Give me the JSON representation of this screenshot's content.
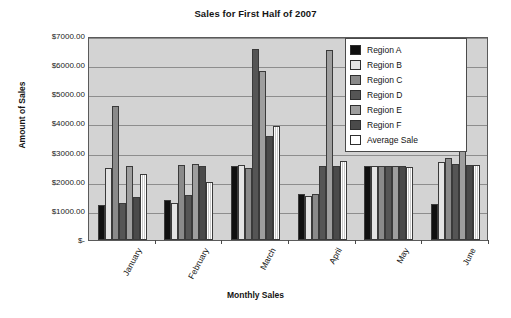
{
  "chart_data": {
    "type": "bar",
    "title": "Sales for First Half of 2007",
    "xlabel": "Monthly Sales",
    "ylabel": "Amount of Sales",
    "categories": [
      "January",
      "February",
      "March",
      "April",
      "May",
      "June"
    ],
    "ylim": [
      0,
      7000
    ],
    "grid": true,
    "legend_position": "top-right",
    "y_ticks": [
      {
        "value": 7000,
        "label": "$7000.00"
      },
      {
        "value": 6000,
        "label": "$6000.00"
      },
      {
        "value": 5000,
        "label": "$5000.00"
      },
      {
        "value": 4000,
        "label": "$4000.00"
      },
      {
        "value": 3000,
        "label": "$3000.00"
      },
      {
        "value": 2000,
        "label": "$2000.00"
      },
      {
        "value": 1000,
        "label": "$1000.00"
      },
      {
        "value": 0,
        "label": "$-"
      }
    ],
    "series": [
      {
        "name": "Region A",
        "color": "#101010",
        "values": [
          1200,
          1360,
          2550,
          1570,
          2550,
          1240
        ]
      },
      {
        "name": "Region B",
        "color": "#e3e3e3",
        "values": [
          2480,
          1260,
          2570,
          1500,
          2540,
          2660
        ]
      },
      {
        "name": "Region C",
        "color": "#8a8a8a",
        "values": [
          4590,
          2560,
          2480,
          1570,
          2550,
          2830
        ]
      },
      {
        "name": "Region D",
        "color": "#555555",
        "values": [
          1270,
          1550,
          6570,
          2530,
          2550,
          2620
        ]
      },
      {
        "name": "Region E",
        "color": "#9e9e9e",
        "values": [
          2550,
          2600,
          5790,
          6530,
          2550,
          3540
        ]
      },
      {
        "name": "Region F",
        "color": "#4a4a4a",
        "values": [
          1460,
          2550,
          3570,
          2540,
          2540,
          2560
        ]
      },
      {
        "name": "Average Sale",
        "color": "#ffffff",
        "values": [
          2270,
          1980,
          3920,
          2710,
          2520,
          2560
        ]
      }
    ]
  },
  "legend": {
    "items": [
      {
        "label": "Region A"
      },
      {
        "label": "Region B"
      },
      {
        "label": "Region C"
      },
      {
        "label": "Region D"
      },
      {
        "label": "Region E"
      },
      {
        "label": "Region F"
      },
      {
        "label": "Average Sale"
      }
    ]
  }
}
